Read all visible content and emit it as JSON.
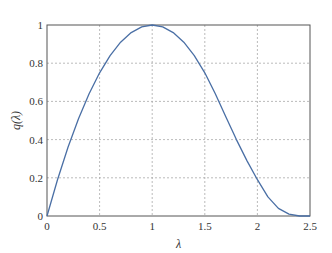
{
  "chart_data": {
    "type": "line",
    "title": "",
    "xlabel": "λ",
    "ylabel": "q(λ)",
    "xlim": [
      0,
      2.5
    ],
    "ylim": [
      0,
      1
    ],
    "grid": true,
    "x_ticks": [
      "0",
      "0.5",
      "1",
      "1.5",
      "2",
      "2.5"
    ],
    "y_ticks": [
      "0",
      "0.2",
      "0.4",
      "0.6",
      "0.8",
      "1"
    ],
    "series": [
      {
        "name": "q(λ)",
        "color": "#4a6fa5",
        "x": [
          0,
          0.1,
          0.2,
          0.3,
          0.4,
          0.5,
          0.6,
          0.7,
          0.8,
          0.9,
          1.0,
          1.1,
          1.2,
          1.3,
          1.4,
          1.5,
          1.6,
          1.7,
          1.8,
          1.9,
          2.0,
          2.1,
          2.2,
          2.3,
          2.4,
          2.5
        ],
        "y": [
          0,
          0.19,
          0.36,
          0.51,
          0.64,
          0.75,
          0.84,
          0.91,
          0.96,
          0.99,
          1.0,
          0.99,
          0.96,
          0.91,
          0.84,
          0.75,
          0.64,
          0.52,
          0.4,
          0.29,
          0.19,
          0.1,
          0.04,
          0.01,
          0.0,
          0.0
        ]
      }
    ]
  }
}
